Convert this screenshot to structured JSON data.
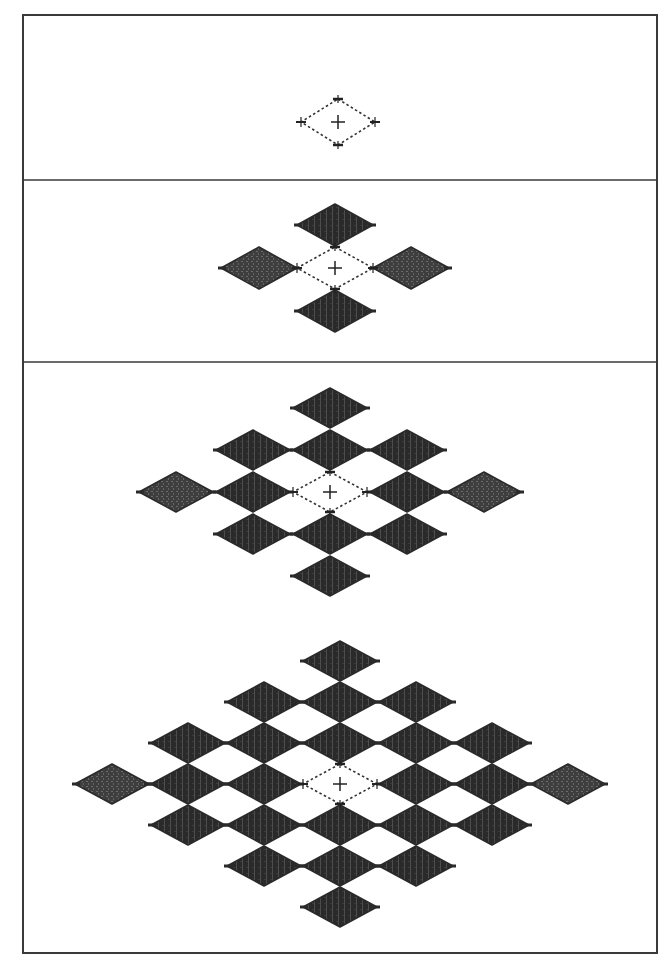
{
  "diagram": {
    "type": "diamond-lattice-growth",
    "colors": {
      "background": "#ffffff",
      "frame": "#3a3a3a",
      "diamond_fill": "#2a2a2a",
      "diamond_light_fill": "#4a4a4a",
      "dotted_outline": "#333333"
    },
    "frame": {
      "x": 23,
      "y": 15,
      "width": 634,
      "height": 938
    },
    "dividers_y": [
      180,
      362
    ],
    "stages": [
      {
        "id": "stage-1",
        "center": [
          338,
          122
        ],
        "cell": {
          "dx": 38,
          "dy": 24
        },
        "diamond": {
          "w": 76,
          "h": 48
        },
        "center_marker": "plus",
        "vertex_marks": true,
        "cells": []
      },
      {
        "id": "stage-2",
        "center": [
          335,
          268
        ],
        "cell": {
          "dx": 76,
          "dy": 43
        },
        "diamond": {
          "w": 78,
          "h": 44
        },
        "center_marker": "plus",
        "vertex_marks": true,
        "cells": [
          {
            "i": 0,
            "j": -1,
            "shade": "dark"
          },
          {
            "i": -1,
            "j": 0,
            "shade": "light"
          },
          {
            "i": 1,
            "j": 0,
            "shade": "light"
          },
          {
            "i": 0,
            "j": 1,
            "shade": "dark"
          }
        ]
      },
      {
        "id": "stage-3",
        "center": [
          330,
          492
        ],
        "cell": {
          "dx": 77,
          "dy": 42
        },
        "diamond": {
          "w": 76,
          "h": 42
        },
        "center_marker": "plus",
        "vertex_marks": true,
        "cells": [
          {
            "i": 0,
            "j": -2,
            "shade": "dark"
          },
          {
            "i": -1,
            "j": -1,
            "shade": "dark"
          },
          {
            "i": 0,
            "j": -1,
            "shade": "dark"
          },
          {
            "i": 1,
            "j": -1,
            "shade": "dark"
          },
          {
            "i": -2,
            "j": 0,
            "shade": "light"
          },
          {
            "i": -1,
            "j": 0,
            "shade": "dark"
          },
          {
            "i": 1,
            "j": 0,
            "shade": "dark"
          },
          {
            "i": 2,
            "j": 0,
            "shade": "light"
          },
          {
            "i": -1,
            "j": 1,
            "shade": "dark"
          },
          {
            "i": 0,
            "j": 1,
            "shade": "dark"
          },
          {
            "i": 1,
            "j": 1,
            "shade": "dark"
          },
          {
            "i": 0,
            "j": 2,
            "shade": "dark"
          }
        ]
      },
      {
        "id": "stage-4",
        "center": [
          340,
          784
        ],
        "cell": {
          "dx": 76,
          "dy": 41
        },
        "diamond": {
          "w": 76,
          "h": 42
        },
        "center_marker": "plus",
        "vertex_marks": true,
        "cells": [
          {
            "i": 0,
            "j": -3,
            "shade": "dark"
          },
          {
            "i": -1,
            "j": -2,
            "shade": "dark"
          },
          {
            "i": 0,
            "j": -2,
            "shade": "dark"
          },
          {
            "i": 1,
            "j": -2,
            "shade": "dark"
          },
          {
            "i": -2,
            "j": -1,
            "shade": "dark"
          },
          {
            "i": -1,
            "j": -1,
            "shade": "dark"
          },
          {
            "i": 0,
            "j": -1,
            "shade": "dark"
          },
          {
            "i": 1,
            "j": -1,
            "shade": "dark"
          },
          {
            "i": 2,
            "j": -1,
            "shade": "dark"
          },
          {
            "i": -3,
            "j": 0,
            "shade": "light"
          },
          {
            "i": -2,
            "j": 0,
            "shade": "dark"
          },
          {
            "i": -1,
            "j": 0,
            "shade": "dark"
          },
          {
            "i": 1,
            "j": 0,
            "shade": "dark"
          },
          {
            "i": 2,
            "j": 0,
            "shade": "dark"
          },
          {
            "i": 3,
            "j": 0,
            "shade": "light"
          },
          {
            "i": -2,
            "j": 1,
            "shade": "dark"
          },
          {
            "i": -1,
            "j": 1,
            "shade": "dark"
          },
          {
            "i": 0,
            "j": 1,
            "shade": "dark"
          },
          {
            "i": 1,
            "j": 1,
            "shade": "dark"
          },
          {
            "i": 2,
            "j": 1,
            "shade": "dark"
          },
          {
            "i": -1,
            "j": 2,
            "shade": "dark"
          },
          {
            "i": 0,
            "j": 2,
            "shade": "dark"
          },
          {
            "i": 1,
            "j": 2,
            "shade": "dark"
          },
          {
            "i": 0,
            "j": 3,
            "shade": "dark"
          }
        ]
      }
    ]
  }
}
